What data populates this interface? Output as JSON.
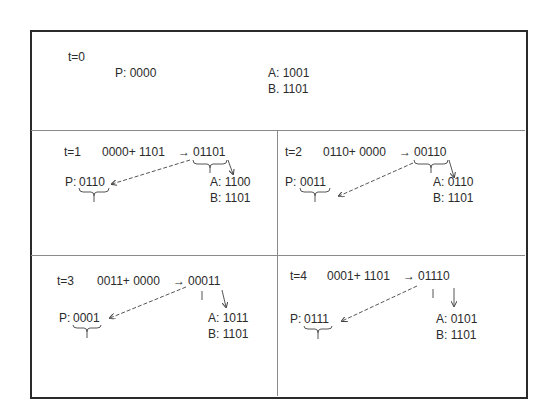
{
  "panels": {
    "t0": {
      "label": "t=0",
      "P": "P: 0000",
      "A": "A: 1001",
      "B": "B. 1101"
    },
    "t1": {
      "label": "t=1",
      "expr": "0000+ 1101",
      "arrow": "→",
      "result": "01101",
      "P_prefix": "P:",
      "P_val": "0110",
      "A": "A: 1100",
      "B": "B: 1101"
    },
    "t2": {
      "label": "t=2",
      "expr": "0110+ 0000",
      "arrow": "→",
      "result": "00110",
      "P_prefix": "P:",
      "P_val": "0011",
      "A": "A: 0110",
      "B": "B: 1101"
    },
    "t3": {
      "label": "t=3",
      "expr": "0011+ 0000",
      "arrow": "→",
      "result": "00011",
      "P_prefix": "P:",
      "P_val": "0001",
      "A": "A: 1011",
      "B": "B: 1101"
    },
    "t4": {
      "label": "t=4",
      "expr": "0001+ 1101",
      "arrow": "→",
      "result": "01110",
      "P_prefix": "P:",
      "P_val": "0111",
      "A": "A: 0101",
      "B": "B: 1101"
    }
  },
  "colors": {
    "border": "#2a2a2a",
    "divider": "#8a8a8a",
    "text": "#2b2b2b"
  }
}
